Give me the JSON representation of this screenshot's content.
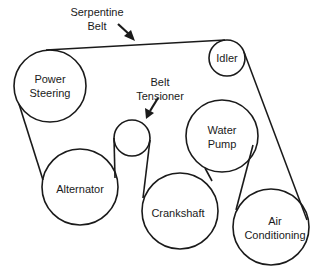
{
  "callouts": [
    {
      "id": "serpentine-belt",
      "lines": [
        "Serpentine",
        "Belt"
      ],
      "x": 97,
      "y": 19
    },
    {
      "id": "belt-tensioner",
      "lines": [
        "Belt",
        "Tensioner"
      ],
      "x": 160,
      "y": 89
    }
  ],
  "pulleys": [
    {
      "id": "power-steering",
      "lines": [
        "Power",
        "Steering"
      ],
      "cx": 50,
      "cy": 86,
      "r": 36
    },
    {
      "id": "idler",
      "lines": [
        "Idler"
      ],
      "cx": 227,
      "cy": 58,
      "r": 18
    },
    {
      "id": "belt-tensioner",
      "lines": [],
      "cx": 132,
      "cy": 138,
      "r": 18
    },
    {
      "id": "alternator",
      "lines": [
        "Alternator"
      ],
      "cx": 80,
      "cy": 187,
      "r": 38
    },
    {
      "id": "water-pump",
      "lines": [
        "Water",
        "Pump"
      ],
      "cx": 222,
      "cy": 136,
      "r": 36
    },
    {
      "id": "crankshaft",
      "lines": [
        "Crankshaft"
      ],
      "cx": 180,
      "cy": 211,
      "r": 38
    },
    {
      "id": "air-conditioning",
      "lines": [
        "Air",
        "Conditioning"
      ],
      "cx": 271,
      "cy": 227,
      "r": 38
    }
  ],
  "colors": {
    "stroke": "#1a1a1a",
    "background": "#ffffff"
  }
}
